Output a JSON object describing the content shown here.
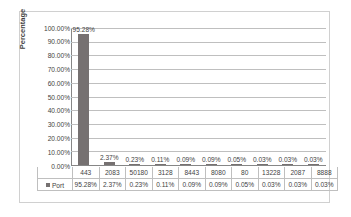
{
  "chart_data": {
    "type": "bar",
    "title": "",
    "xlabel": "",
    "ylabel": "Percentage",
    "ylim": [
      0,
      100
    ],
    "grid": true,
    "legend_position": "table-left",
    "categories": [
      "443",
      "2083",
      "50180",
      "3128",
      "8443",
      "8080",
      "80",
      "13228",
      "2087",
      "8888"
    ],
    "series": [
      {
        "name": "Port",
        "color": "#767171",
        "values": [
          95.28,
          2.37,
          0.23,
          0.11,
          0.09,
          0.09,
          0.05,
          0.03,
          0.03,
          0.03
        ],
        "value_labels": [
          "95.28%",
          "2.37%",
          "0.23%",
          "0.11%",
          "0.09%",
          "0.09%",
          "0.05%",
          "0.03%",
          "0.03%",
          "0.03%"
        ]
      }
    ],
    "ytick_labels": [
      "100.00%",
      "90.00%",
      "80.00%",
      "70.00%",
      "60.00%",
      "50.00%",
      "40.00%",
      "30.00%",
      "20.00%",
      "10.00%",
      "0.00%"
    ],
    "ytick_values": [
      100,
      90,
      80,
      70,
      60,
      50,
      40,
      30,
      20,
      10,
      0
    ]
  },
  "axis": {
    "y_title": "Percentage"
  },
  "legend": {
    "series_label": "Port"
  }
}
